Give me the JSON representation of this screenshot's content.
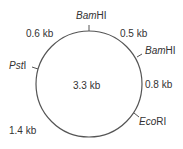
{
  "plasmid": {
    "total_size": "3.3 kb",
    "sites": [
      {
        "name": "Bam",
        "suffix": "HI"
      },
      {
        "name": "Bam",
        "suffix": "HI"
      },
      {
        "name": "Eco",
        "suffix": "RI"
      },
      {
        "name": "Pst",
        "suffix": "I"
      }
    ],
    "segments": [
      "0.5 kb",
      "0.8 kb",
      "1.4 kb",
      "0.6 kb"
    ]
  }
}
